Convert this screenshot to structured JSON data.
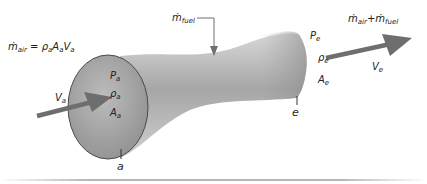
{
  "diagram": {
    "inlet": {
      "station_label": "a",
      "mass_flow_equation": {
        "lhs_symbol": "ṁ",
        "lhs_sub": "air",
        "rho": "ρ",
        "rho_sub": "a",
        "area": "A",
        "area_sub": "a",
        "vel": "V",
        "vel_sub": "a"
      },
      "pressure": {
        "sym": "P",
        "sub": "a"
      },
      "density": {
        "sym": "ρ",
        "sub": "a"
      },
      "area": {
        "sym": "A",
        "sub": "a"
      },
      "velocity": {
        "sym": "V",
        "sub": "a"
      }
    },
    "fuel": {
      "sym": "ṁ",
      "sub": "fuel"
    },
    "exit": {
      "station_label": "e",
      "pressure": {
        "sym": "P",
        "sub": "e"
      },
      "density": {
        "sym": "ρ",
        "sub": "e"
      },
      "area": {
        "sym": "A",
        "sub": "e"
      },
      "velocity": {
        "sym": "V",
        "sub": "e"
      },
      "mass_flow": {
        "sym1": "ṁ",
        "sub1": "air",
        "plus": "+",
        "sym2": "ṁ",
        "sub2": "fuel"
      }
    },
    "colors": {
      "body_light": "#d2d2d2",
      "body_dark": "#8e8e8e",
      "inlet_face": "#a8a8a8",
      "arrow": "#6e6e6e",
      "rule": "#b0b0b0"
    }
  }
}
